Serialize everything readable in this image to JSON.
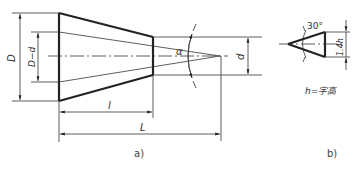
{
  "figure_a": {
    "caption": "a)",
    "labels": {
      "D": "D",
      "D_minus_d": "D−d",
      "alpha": "α",
      "d": "d",
      "l": "l",
      "L": "L"
    }
  },
  "figure_b": {
    "caption": "b)",
    "angle_label": "30°",
    "height_label": "1.4h",
    "note": "h=字高"
  },
  "colors": {
    "line": "#222222",
    "background": "#ffffff"
  }
}
